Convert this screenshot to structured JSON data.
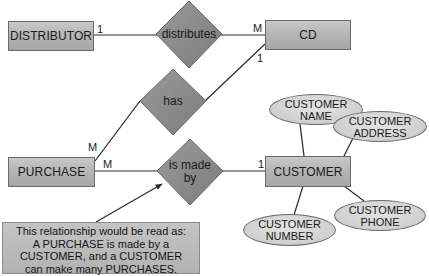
{
  "entities": {
    "distributor": "DISTRIBUTOR",
    "cd": "CD",
    "purchase": "PURCHASE",
    "customer": "CUSTOMER"
  },
  "relationships": {
    "distributes": "distributes",
    "has": "has",
    "is_made_by": [
      "is made",
      "by"
    ]
  },
  "attributes": {
    "customer_name": [
      "CUSTOMER",
      "NAME"
    ],
    "customer_address": [
      "CUSTOMER",
      "ADDRESS"
    ],
    "customer_number": [
      "CUSTOMER",
      "NUMBER"
    ],
    "customer_phone": [
      "CUSTOMER",
      "PHONE"
    ]
  },
  "cardinalities": {
    "distributor_distributes": "1",
    "distributes_cd": "M",
    "cd_has": "1",
    "has_purchase": "M",
    "purchase_is_made_by": "M",
    "is_made_by_customer": "1"
  },
  "callout": {
    "lines": [
      "This relationship would be read as:",
      "A PURCHASE is made by a",
      "CUSTOMER, and a CUSTOMER",
      "can make many PURCHASES."
    ]
  },
  "colors": {
    "entity_fill": "#b4b4b4",
    "relationship_fill": "#8c8c8c",
    "attribute_fill": "#d2d2d2",
    "line": "#2a2a2a"
  }
}
